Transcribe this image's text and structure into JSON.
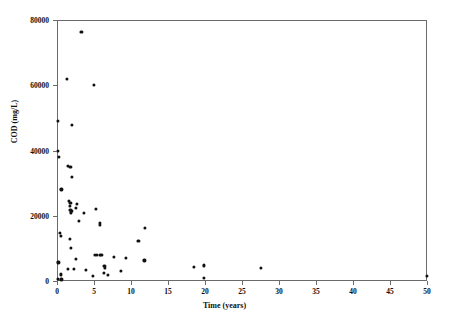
{
  "chart_data": {
    "type": "scatter",
    "title": "",
    "xlabel": "Time (years)",
    "ylabel": "COD (mg/L)",
    "xlim": [
      0,
      50
    ],
    "ylim": [
      0,
      80000
    ],
    "xticks": [
      0,
      5,
      10,
      15,
      20,
      25,
      30,
      35,
      40,
      45,
      50
    ],
    "xticklabels": [
      "0",
      "5",
      "10",
      "15",
      "20",
      "25",
      "30",
      "35",
      "40",
      "45",
      "50"
    ],
    "yticks": [
      0,
      20000,
      40000,
      60000,
      80000
    ],
    "yticklabels": [
      "0",
      "20000",
      "40000",
      "60000",
      "80000"
    ],
    "grid": false,
    "legend": null,
    "marker": "filled-circle",
    "marker_color": "#101010",
    "axis_color": "#6b6b6b",
    "background": "#ffffff",
    "series": [
      {
        "name": "COD vs landfill age",
        "points": [
          [
            3.3,
            76300
          ],
          [
            1.3,
            62000
          ],
          [
            5.0,
            60200
          ],
          [
            0.1,
            49000
          ],
          [
            2.0,
            47800
          ],
          [
            0.1,
            40000
          ],
          [
            0.3,
            38000
          ],
          [
            1.5,
            35200
          ],
          [
            1.8,
            34900
          ],
          [
            2.0,
            31800
          ],
          [
            0.6,
            28100
          ],
          [
            1.6,
            24600
          ],
          [
            1.8,
            24000
          ],
          [
            2.7,
            23600
          ],
          [
            1.7,
            22900
          ],
          [
            2.6,
            22500
          ],
          [
            1.8,
            21800
          ],
          [
            2.0,
            21400
          ],
          [
            1.9,
            21000
          ],
          [
            5.3,
            22000
          ],
          [
            3.6,
            20900
          ],
          [
            3.0,
            18400
          ],
          [
            5.8,
            17900
          ],
          [
            5.8,
            17100
          ],
          [
            11.9,
            16200
          ],
          [
            0.4,
            14700
          ],
          [
            0.5,
            13800
          ],
          [
            1.7,
            12800
          ],
          [
            11.0,
            12400
          ],
          [
            1.9,
            10200
          ],
          [
            5.1,
            8000
          ],
          [
            5.4,
            8000
          ],
          [
            5.8,
            8100
          ],
          [
            6.0,
            8000
          ],
          [
            7.7,
            7400
          ],
          [
            2.6,
            6800
          ],
          [
            9.3,
            7000
          ],
          [
            0.2,
            5700
          ],
          [
            11.8,
            6300
          ],
          [
            19.9,
            4800
          ],
          [
            18.5,
            4400
          ],
          [
            27.5,
            4000
          ],
          [
            6.4,
            4700
          ],
          [
            6.5,
            4100
          ],
          [
            1.5,
            3700
          ],
          [
            2.3,
            3800
          ],
          [
            3.9,
            3400
          ],
          [
            8.6,
            3100
          ],
          [
            6.3,
            2600
          ],
          [
            0.5,
            2000
          ],
          [
            6.9,
            1800
          ],
          [
            4.9,
            1500
          ],
          [
            50.0,
            1500
          ],
          [
            19.8,
            1000
          ],
          [
            0.1,
            700
          ],
          [
            0.6,
            500
          ]
        ]
      }
    ]
  },
  "axes": {
    "x_label": "Time (years)",
    "y_label": "COD (mg/L)"
  }
}
